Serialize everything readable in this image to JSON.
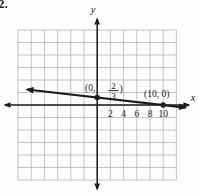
{
  "problem_number": "2.",
  "figure": {
    "y_axis_label": "y",
    "x_axis_label": "x",
    "x_tick_labels": [
      "2",
      "4",
      "6",
      "8",
      "10"
    ],
    "point_labels": {
      "y_intercept": {
        "open": "(0,",
        "numerator": "2",
        "denominator": "3",
        "close": ")"
      },
      "x_intercept": "(10, 0)"
    },
    "colors": {
      "ink": "#1c1c1c",
      "grid": "#b3b6ba",
      "background": "#fcfcfa"
    }
  },
  "chart_data": {
    "type": "line",
    "title": "",
    "xlabel": "x",
    "ylabel": "y",
    "xlim": [
      -12,
      12
    ],
    "ylim": [
      -12,
      12
    ],
    "x_ticks": [
      2,
      4,
      6,
      8,
      10
    ],
    "grid": true,
    "units_per_grid_cell": 2,
    "series": [
      {
        "name": "plotted-line",
        "arrows_both_ends": true,
        "points": [
          {
            "x": 0,
            "y": 0.6667,
            "label": "(0, 2/3)"
          },
          {
            "x": 10,
            "y": 0,
            "label": "(10, 0)"
          }
        ]
      }
    ]
  }
}
